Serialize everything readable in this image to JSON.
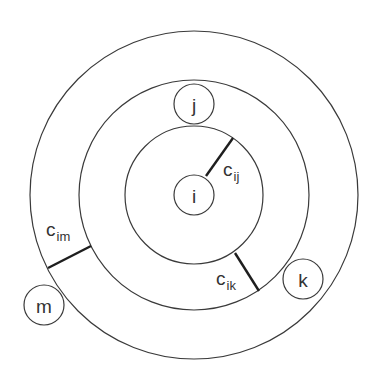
{
  "diagram": {
    "center": {
      "x": 194,
      "y": 195
    },
    "rings": [
      {
        "name": "inner-ring",
        "r": 69
      },
      {
        "name": "middle-ring",
        "r": 115
      },
      {
        "name": "outer-ring",
        "r": 164
      }
    ],
    "nodes": [
      {
        "id": "i",
        "label": "i",
        "x": 194,
        "y": 195,
        "r": 20
      },
      {
        "id": "j",
        "label": "j",
        "x": 194,
        "y": 104,
        "r": 20
      },
      {
        "id": "k",
        "label": "k",
        "x": 303,
        "y": 279,
        "r": 20
      },
      {
        "id": "m",
        "label": "m",
        "x": 44,
        "y": 305,
        "r": 20
      }
    ],
    "edges": [
      {
        "id": "c_ij",
        "label_main": "c",
        "label_sub": "ij",
        "x1": 206,
        "y1": 176,
        "x2": 233,
        "y2": 138,
        "lx": 223,
        "ly": 176
      },
      {
        "id": "c_ik",
        "label_main": "c",
        "label_sub": "ik",
        "x1": 235,
        "y1": 253,
        "x2": 259,
        "y2": 291,
        "lx": 216,
        "ly": 285
      },
      {
        "id": "c_im",
        "label_main": "c",
        "label_sub": "im",
        "x1": 48,
        "y1": 268,
        "x2": 91,
        "y2": 246,
        "lx": 46,
        "ly": 236
      }
    ]
  }
}
